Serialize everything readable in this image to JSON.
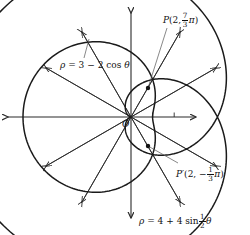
{
  "figure": {
    "width": 250,
    "height": 235,
    "background": "#ffffff",
    "ink_color": "#1a1a1a"
  },
  "origin": {
    "label": "O",
    "x": 131,
    "y": 117
  },
  "scale": {
    "pixels_per_unit": 21.6,
    "tick_values": [
      1,
      2
    ],
    "tick_count": 2
  },
  "axes": {
    "horizontal": {
      "name": "polar-axis",
      "left_end_x": 8,
      "right_end_x": 196,
      "y": 117,
      "arrow_both_ends": true
    },
    "vertical": {
      "name": "vertical-axis",
      "top_end_y": 13,
      "bottom_end_y": 218,
      "x": 131,
      "arrow_both_ends": true
    }
  },
  "rays": {
    "description": "Radial guide lines every 30 degrees with arrowheads",
    "angles_deg": [
      30,
      60,
      120,
      150,
      210,
      240,
      300,
      330
    ],
    "length_px": 98
  },
  "curves": [
    {
      "name": "limacon",
      "equation_text": "ρ = 3 − 2 cos θ",
      "rho_parts": {
        "a": 3,
        "b": -2,
        "fn": "cos",
        "freq": 1
      },
      "label": {
        "rho": "ρ",
        "equals": "=",
        "expr_a": "3",
        "minus": "−",
        "expr_b": "2",
        "fn": "cos",
        "theta": "θ"
      },
      "label_pos": {
        "x": 60,
        "y": 61
      },
      "leader_to": {
        "x": 89,
        "y": 39
      }
    },
    {
      "name": "cardioid",
      "equation_text": "ρ = 4 + 4 sin ½θ",
      "rho_parts": {
        "a": 4,
        "b": 4,
        "fn": "sin",
        "freq": 0.5
      },
      "label": {
        "rho": "ρ",
        "equals": "=",
        "expr_a": "4",
        "plus": "+",
        "expr_b": "4",
        "fn": "sin",
        "frac_num": "1",
        "frac_den": "2",
        "theta": "θ"
      },
      "label_pos": {
        "x": 139,
        "y": 213
      },
      "leader_to": null
    }
  ],
  "points": [
    {
      "name": "point-p",
      "label_name": "P",
      "prime": "",
      "radius": "2",
      "angle_num": "7",
      "angle_den": "3",
      "angle_sign": "",
      "pi": "π",
      "comma": ",",
      "open_paren": "(",
      "close_paren": ")",
      "plot": {
        "x": 148,
        "y": 88
      },
      "label_pos": {
        "x": 163,
        "y": 12
      },
      "leader_from": {
        "x": 167,
        "y": 28
      }
    },
    {
      "name": "point-p-prime",
      "label_name": "P",
      "prime": "′",
      "radius": "2",
      "angle_num": "1",
      "angle_den": "3",
      "angle_sign": "−",
      "pi": "π",
      "comma": ",",
      "open_paren": "(",
      "close_paren": ")",
      "plot": {
        "x": 148,
        "y": 146
      },
      "label_pos": {
        "x": 176,
        "y": 166
      },
      "leader_from": {
        "x": 178,
        "y": 163
      }
    }
  ],
  "chart_data": {
    "type": "line",
    "coordinate_system": "polar",
    "title": "",
    "xlabel": "",
    "ylabel": "",
    "grid": false,
    "legend": "inline-annotations",
    "axis_tick_values": [
      1,
      2
    ],
    "series": [
      {
        "name": "ρ = 3 − 2 cos θ",
        "type": "limacon",
        "theta_range_deg": [
          0,
          360
        ],
        "rho_formula": "3 - 2*cos(theta)",
        "rho_min": 1,
        "rho_max": 5,
        "sample_points": [
          {
            "theta_deg": 0,
            "rho": 1
          },
          {
            "theta_deg": 30,
            "rho": 1.27
          },
          {
            "theta_deg": 60,
            "rho": 2
          },
          {
            "theta_deg": 90,
            "rho": 3
          },
          {
            "theta_deg": 120,
            "rho": 4
          },
          {
            "theta_deg": 150,
            "rho": 4.73
          },
          {
            "theta_deg": 180,
            "rho": 5
          },
          {
            "theta_deg": 210,
            "rho": 4.73
          },
          {
            "theta_deg": 240,
            "rho": 4
          },
          {
            "theta_deg": 270,
            "rho": 3
          },
          {
            "theta_deg": 300,
            "rho": 2
          },
          {
            "theta_deg": 330,
            "rho": 1.27
          },
          {
            "theta_deg": 360,
            "rho": 1
          }
        ]
      },
      {
        "name": "ρ = 4 + 4 sin ½θ",
        "type": "cardioid",
        "theta_range_deg": [
          0,
          720
        ],
        "rho_formula": "4 + 4*sin(theta/2)",
        "rho_min": 0,
        "rho_max": 8,
        "sample_points": [
          {
            "theta_deg": 0,
            "rho": 4
          },
          {
            "theta_deg": 60,
            "rho": 6
          },
          {
            "theta_deg": 120,
            "rho": 7.46
          },
          {
            "theta_deg": 180,
            "rho": 8
          },
          {
            "theta_deg": 240,
            "rho": 7.46
          },
          {
            "theta_deg": 300,
            "rho": 6
          },
          {
            "theta_deg": 360,
            "rho": 4
          },
          {
            "theta_deg": 420,
            "rho": 2
          },
          {
            "theta_deg": 480,
            "rho": 0.54
          },
          {
            "theta_deg": 540,
            "rho": 0
          },
          {
            "theta_deg": 600,
            "rho": 0.54
          },
          {
            "theta_deg": 660,
            "rho": 2
          },
          {
            "theta_deg": 720,
            "rho": 4
          }
        ]
      }
    ],
    "intersection_points": [
      {
        "label": "P",
        "rho": 2,
        "theta": "7π/3",
        "theta_deg": 420
      },
      {
        "label": "P′",
        "rho": 2,
        "theta": "-π/3",
        "theta_deg": -60
      }
    ]
  }
}
